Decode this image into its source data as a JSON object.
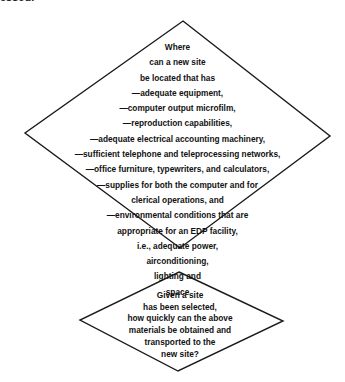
{
  "header_fragment": "essed.",
  "diagram": {
    "decision1": {
      "shape": "diamond",
      "lines": [
        "Where",
        "can a new site",
        "be located that has",
        "—adequate equipment,",
        "—computer output microfilm,",
        "—reproduction capabilities,",
        "—adequate electrical accounting machinery,",
        "—sufficient telephone and teleprocessing networks,",
        "—office furniture, typewriters, and calculators,",
        "—supplies for both the computer and for",
        "clerical operations, and",
        "—environmental conditions that are",
        "appropriate for an EDP facility,",
        "i.e., adequate power,",
        "airconditioning,",
        "lighting and",
        "space"
      ]
    },
    "decision2": {
      "shape": "diamond",
      "lines": [
        "Given a site",
        "has been selected,",
        "how quickly can the above",
        "materials be obtained and",
        "transported to the",
        "new site?"
      ]
    },
    "stroke_color": "#1a1a1a"
  }
}
